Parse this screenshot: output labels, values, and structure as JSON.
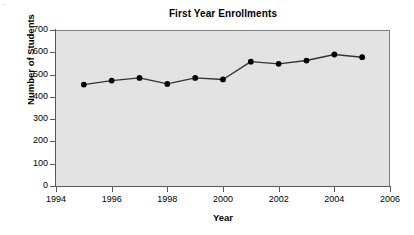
{
  "figure": {
    "background_color": "#ffffff",
    "plot_background_color": "#e3e3e3",
    "axis_color": "#5a5a5a",
    "series_color": "#333333",
    "marker_color": "#000000"
  },
  "chart_data": {
    "type": "line",
    "title": "First Year Enrollments",
    "xlabel": "Year",
    "ylabel": "Number of Students",
    "x": [
      1995,
      1996,
      1997,
      1998,
      1999,
      2000,
      2001,
      2002,
      2003,
      2004,
      2005
    ],
    "values": [
      455,
      473,
      485,
      458,
      485,
      478,
      558,
      548,
      563,
      590,
      578
    ],
    "series": [
      {
        "name": "First Year Enrollments",
        "values": [
          455,
          473,
          485,
          458,
          485,
          478,
          558,
          548,
          563,
          590,
          578
        ]
      }
    ],
    "xlim": [
      1994,
      2006
    ],
    "ylim": [
      0,
      700
    ],
    "xticks": [
      1994,
      1996,
      1998,
      2000,
      2002,
      2004,
      2006
    ],
    "xtick_labels": [
      "1994",
      "1996",
      "1998",
      "2000",
      "2002",
      "2004",
      "2006"
    ],
    "yticks": [
      0,
      100,
      200,
      300,
      400,
      500,
      600,
      700
    ],
    "ytick_labels": [
      "0",
      "100",
      "200",
      "300",
      "400",
      "500",
      "600",
      "700"
    ],
    "grid": false,
    "legend": false,
    "legend_position": "none",
    "marker": "circle",
    "annotations": []
  }
}
